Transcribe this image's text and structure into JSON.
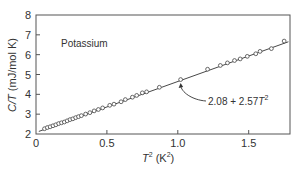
{
  "chart_data": {
    "type": "scatter",
    "title": "",
    "xlabel": "T^2 (K^2)",
    "ylabel": "C/T (mJ/mol K)",
    "xlim": [
      0,
      1.8
    ],
    "ylim": [
      2,
      8
    ],
    "xticks": [
      0,
      0.5,
      1.0,
      1.5
    ],
    "xtick_labels": [
      "0",
      "0.5",
      "1.0",
      "1.5"
    ],
    "yticks": [
      2,
      3,
      4,
      5,
      6,
      7,
      8
    ],
    "ytick_labels": [
      "2",
      "3",
      "4",
      "5",
      "6",
      "7",
      "8"
    ],
    "grid": false,
    "legend": null,
    "annotations": [
      {
        "text": "Potassium",
        "x": 0.11,
        "y": 6.3
      },
      {
        "text": "2.08 + 2.57T^2",
        "points_to": [
          1.02,
          4.7
        ]
      }
    ],
    "series": [
      {
        "name": "Potassium data",
        "marker": "open-circle",
        "x": [
          0.06,
          0.08,
          0.1,
          0.12,
          0.14,
          0.16,
          0.18,
          0.2,
          0.22,
          0.24,
          0.26,
          0.28,
          0.3,
          0.32,
          0.35,
          0.38,
          0.41,
          0.44,
          0.47,
          0.52,
          0.55,
          0.6,
          0.63,
          0.68,
          0.71,
          0.75,
          0.78,
          0.87,
          1.02,
          1.21,
          1.3,
          1.35,
          1.4,
          1.44,
          1.49,
          1.55,
          1.58,
          1.66,
          1.75
        ],
        "y": [
          2.24,
          2.3,
          2.34,
          2.39,
          2.44,
          2.5,
          2.54,
          2.58,
          2.64,
          2.7,
          2.74,
          2.8,
          2.85,
          2.9,
          2.98,
          3.05,
          3.14,
          3.21,
          3.29,
          3.42,
          3.48,
          3.6,
          3.71,
          3.83,
          3.92,
          4.05,
          4.1,
          4.33,
          4.72,
          5.24,
          5.43,
          5.56,
          5.68,
          5.76,
          5.89,
          6.02,
          6.14,
          6.28,
          6.66
        ]
      },
      {
        "name": "Fit: 2.08 + 2.57T^2",
        "type": "line",
        "intercept": 2.08,
        "slope": 2.57,
        "x": [
          0.02,
          1.78
        ],
        "y": [
          2.13,
          6.65
        ]
      }
    ]
  },
  "labels": {
    "material": "Potassium",
    "fit_formula_main": "2.08 + 2.57",
    "fit_formula_var": "T",
    "fit_formula_exp": "2",
    "xlabel_var": "T",
    "xlabel_exp": "2",
    "xlabel_unit_open": " (K",
    "xlabel_unit_exp": "2",
    "xlabel_unit_close": ")",
    "ylabel_var": "C/T",
    "ylabel_unit": " (mJ/mol K)"
  },
  "colors": {
    "axis": "#555555",
    "line": "#333333",
    "marker_stroke": "#444444",
    "text": "#333333"
  }
}
